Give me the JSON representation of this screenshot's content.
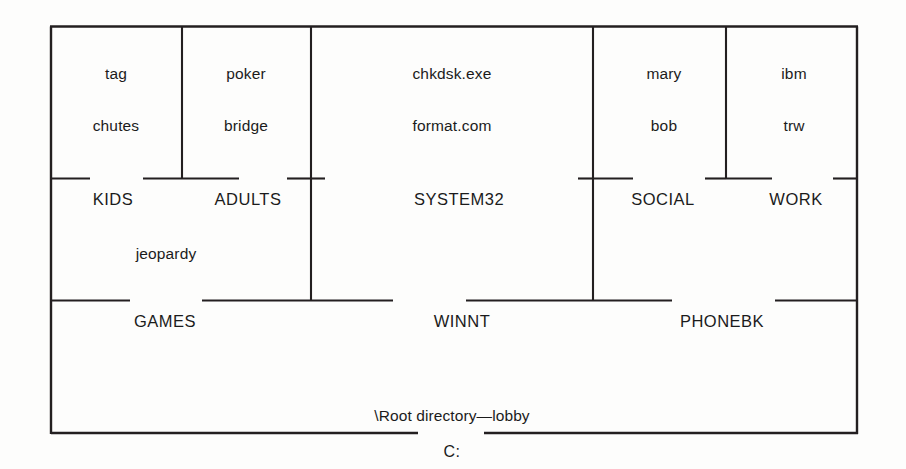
{
  "diagram": {
    "title_caption": "\\Root directory—lobby",
    "drive_label": "C:",
    "line_color": "#231f20",
    "background_color": "#fdfdfc",
    "rooms": [
      {
        "id": "kids",
        "name": "KIDS",
        "files": [
          "tag",
          "chutes"
        ]
      },
      {
        "id": "adults",
        "name": "ADULTS",
        "files": [
          "poker",
          "bridge"
        ]
      },
      {
        "id": "games",
        "name": "GAMES",
        "files": [
          "jeopardy"
        ]
      },
      {
        "id": "system32",
        "name": "SYSTEM32",
        "files": [
          "chkdsk.exe",
          "format.com"
        ]
      },
      {
        "id": "winnt",
        "name": "WINNT",
        "files": []
      },
      {
        "id": "social",
        "name": "SOCIAL",
        "files": [
          "mary",
          "bob"
        ]
      },
      {
        "id": "work",
        "name": "WORK",
        "files": [
          "ibm",
          "trw"
        ]
      },
      {
        "id": "phonebk",
        "name": "PHONEBK",
        "files": []
      }
    ],
    "labels": {
      "file_tag": "tag",
      "file_chutes": "chutes",
      "file_poker": "poker",
      "file_bridge": "bridge",
      "file_chkdsk": "chkdsk.exe",
      "file_format": "format.com",
      "file_mary": "mary",
      "file_bob": "bob",
      "file_ibm": "ibm",
      "file_trw": "trw",
      "file_jeopardy": "jeopardy",
      "room_kids": "KIDS",
      "room_adults": "ADULTS",
      "room_system32": "SYSTEM32",
      "room_social": "SOCIAL",
      "room_work": "WORK",
      "room_games": "GAMES",
      "room_winnt": "WINNT",
      "room_phonebk": "PHONEBK"
    }
  }
}
